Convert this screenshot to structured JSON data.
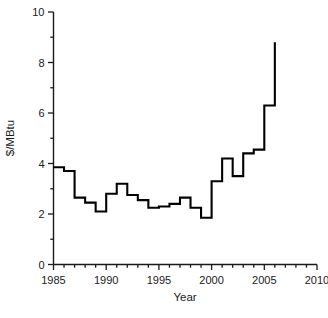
{
  "chart_data": {
    "type": "line",
    "style": "step-post",
    "title": "",
    "subtitle": "",
    "xlabel": "Year",
    "ylabel": "$/MBtu",
    "xlim": [
      1985,
      2010
    ],
    "ylim": [
      0,
      10
    ],
    "grid": false,
    "legend": null,
    "x_major_ticks": [
      1985,
      1990,
      1995,
      2000,
      2005,
      2010
    ],
    "x_major_tick_labels": [
      "1985",
      "1990",
      "1995",
      "2000",
      "2005",
      "2010"
    ],
    "x_minor_tick_interval": 1,
    "y_major_ticks": [
      0,
      2,
      4,
      6,
      8,
      10
    ],
    "y_major_tick_labels": [
      "0",
      "2",
      "4",
      "6",
      "8",
      "10"
    ],
    "y_minor_tick_interval": 1,
    "line_color": "#000000",
    "line_width": 2.1,
    "series": [
      {
        "name": "Natural gas price",
        "x": [
          1985,
          1986,
          1987,
          1988,
          1989,
          1990,
          1991,
          1992,
          1993,
          1994,
          1995,
          1996,
          1997,
          1998,
          1999,
          2000,
          2001,
          2002,
          2003,
          2004,
          2005,
          2006
        ],
        "values": [
          3.85,
          3.7,
          2.65,
          2.45,
          2.1,
          2.8,
          3.2,
          2.75,
          2.55,
          2.25,
          2.3,
          2.4,
          2.65,
          2.25,
          1.85,
          3.3,
          4.2,
          3.5,
          4.4,
          4.55,
          6.3,
          8.8
        ]
      }
    ],
    "annotations": []
  },
  "axes": {
    "x_title": "Year",
    "y_title": "$/MBtu"
  }
}
